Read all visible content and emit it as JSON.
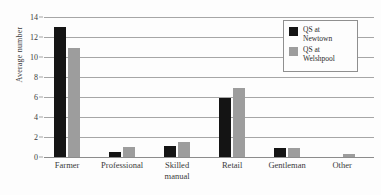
{
  "chart_data": {
    "type": "bar",
    "title": "",
    "xlabel": "",
    "ylabel": "Average number",
    "ylim": [
      0,
      14
    ],
    "ytick_step": 2,
    "yticks": [
      0,
      2,
      4,
      6,
      8,
      10,
      12,
      14
    ],
    "ytick_labels": [
      "0",
      "2",
      "4",
      "6",
      "8",
      "10",
      "12",
      "14"
    ],
    "grid": true,
    "legend_position": "top-right",
    "categories": [
      "Farmer",
      "Professional",
      "Skilled\nmanual",
      "Retail",
      "Gentleman",
      "Other"
    ],
    "series": [
      {
        "name": "QS at\nNewtown",
        "color": "#141414",
        "values": [
          13.0,
          0.5,
          1.1,
          5.9,
          0.9,
          0
        ]
      },
      {
        "name": "QS at\nWelshpool",
        "color": "#9d9d9d",
        "values": [
          10.9,
          1.0,
          1.5,
          6.9,
          0.9,
          0.35
        ]
      }
    ]
  },
  "style": {
    "background": "#fdfdfd",
    "gridline_color": "#a6a6a6",
    "axis_color": "#8c8c8c",
    "text_color": "#3a3a3a",
    "legend_border": "#8f8f8f"
  }
}
